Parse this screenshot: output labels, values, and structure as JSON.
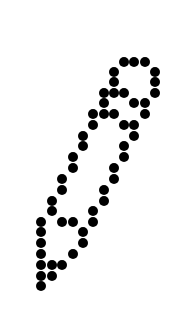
{
  "icon": {
    "name": "dotted-pencil",
    "description": "pencil glyph drawn with dots",
    "dot_color": "#000000",
    "background_color": "#ffffff"
  }
}
